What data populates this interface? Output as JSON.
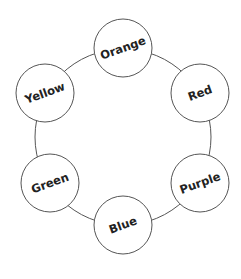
{
  "diagram": {
    "type": "cycle",
    "ring": {
      "cx": 123,
      "cy": 137,
      "r": 88,
      "stroke": "#555555"
    },
    "node_radius": 29,
    "node_stroke": "#555555",
    "node_fill": "#ffffff",
    "text_color": "#222222",
    "nodes": [
      {
        "label": "Orange",
        "cx": 123,
        "cy": 48,
        "rotate": -20
      },
      {
        "label": "Red",
        "cx": 200,
        "cy": 93,
        "rotate": -20
      },
      {
        "label": "Purple",
        "cx": 200,
        "cy": 183,
        "rotate": -20
      },
      {
        "label": "Blue",
        "cx": 123,
        "cy": 225,
        "rotate": -20
      },
      {
        "label": "Green",
        "cx": 50,
        "cy": 183,
        "rotate": -20
      },
      {
        "label": "Yellow",
        "cx": 45,
        "cy": 93,
        "rotate": -20
      }
    ]
  }
}
